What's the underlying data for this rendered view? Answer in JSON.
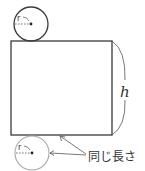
{
  "diagram": {
    "type": "cylinder-net",
    "colors": {
      "stroke": "#3a3a3a",
      "light_stroke": "#a8a8a8",
      "arrow": "#555555",
      "text": "#333333",
      "background": "#ffffff"
    },
    "top_circle": {
      "radius_label": "r"
    },
    "bottom_circle": {
      "radius_label": "r"
    },
    "rectangle": {
      "height_label": "h"
    },
    "annotation": {
      "label": "同じ長さ"
    }
  }
}
